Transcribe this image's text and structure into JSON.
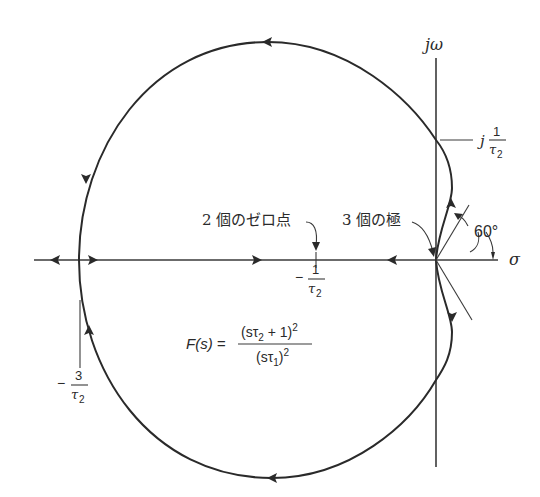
{
  "figure": {
    "type": "root-locus",
    "axes": {
      "imag_label": "jω",
      "real_label": "σ"
    },
    "labels": {
      "zeros_annotation": "2 個のゼロ点",
      "poles_annotation": "3 個の極",
      "angle": "60°",
      "imag_crossing_prefix": "j",
      "imag_crossing_num": "1",
      "imag_crossing_den": "τ",
      "imag_crossing_den_sub": "2",
      "zero_point_sign": "−",
      "zero_point_num": "1",
      "zero_point_den": "τ",
      "zero_point_den_sub": "2",
      "breakaway_sign": "−",
      "breakaway_num": "3",
      "breakaway_den": "τ",
      "breakaway_den_sub": "2"
    },
    "transfer_function": {
      "lhs": "F(s) =",
      "numerator_open": "(sτ",
      "numerator_sub": "2",
      "numerator_close": " + 1)",
      "numerator_exp": "2",
      "denominator_open": "(sτ",
      "denominator_sub": "1",
      "denominator_close": ")",
      "denominator_exp": "2"
    },
    "points": {
      "zeros": {
        "real": "-1/τ2",
        "multiplicity": 2
      },
      "poles": {
        "real": "0",
        "multiplicity": 3
      },
      "breakaway": {
        "real": "-3/τ2"
      },
      "imag_crossing": {
        "imag": "±1/τ2"
      },
      "asymptote_angle_deg": 60
    }
  }
}
